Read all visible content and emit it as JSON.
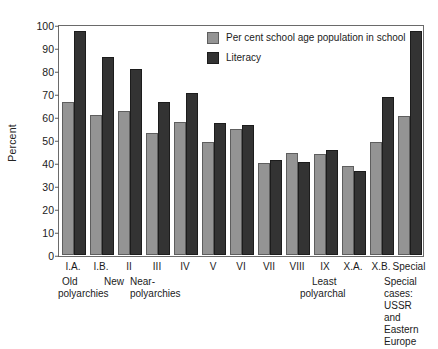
{
  "chart_data": {
    "type": "bar",
    "title": "",
    "xlabel": "",
    "ylabel": "Percent",
    "ylim": [
      0,
      100
    ],
    "yticks": [
      0,
      10,
      20,
      30,
      40,
      50,
      60,
      70,
      80,
      90,
      100
    ],
    "grid": false,
    "legend_position": "top-right",
    "categories": [
      "I.A.",
      "I.B.",
      "II",
      "III",
      "IV",
      "V",
      "VI",
      "VII",
      "VIII",
      "IX",
      "X.A.",
      "X.B.",
      "Special"
    ],
    "series": [
      {
        "name": "Per cent school age population in school",
        "color": "#949494",
        "values": [
          66.5,
          61,
          62.5,
          53,
          58,
          49,
          55,
          40,
          44.5,
          44,
          38.5,
          49,
          60.5
        ]
      },
      {
        "name": "Literacy",
        "color": "#333333",
        "values": [
          97.5,
          86,
          81,
          66.5,
          70.5,
          57.5,
          56.5,
          41.5,
          40.5,
          45.5,
          36.5,
          68.5,
          97.5
        ]
      }
    ],
    "captions": [
      {
        "lines": [
          "Old",
          "polyarchies"
        ],
        "under": "I.A."
      },
      {
        "lines": [
          "New"
        ],
        "under": "I.B."
      },
      {
        "lines": [
          "Near-",
          "polyarchies"
        ],
        "under": "II"
      },
      {
        "lines": [
          "Least",
          "polyarchal"
        ],
        "under": "X.A."
      },
      {
        "lines": [
          "Special",
          "cases:",
          "USSR",
          "and",
          "Eastern",
          "Europe"
        ],
        "under": "Special"
      }
    ]
  },
  "legend": {
    "items": [
      {
        "label": "Per cent school age population in school",
        "swatch": "light"
      },
      {
        "label": "Literacy",
        "swatch": "dark"
      }
    ]
  },
  "axis": {
    "y_title": "Percent",
    "y_ticks": [
      "100",
      "90",
      "80",
      "70",
      "60",
      "50",
      "40",
      "30",
      "20",
      "10",
      "0"
    ],
    "x_ticks": [
      "I.A.",
      "I.B.",
      "II",
      "III",
      "IV",
      "V",
      "VI",
      "VII",
      "VIII",
      "IX",
      "X.A.",
      "X.B.",
      "Special"
    ]
  },
  "captions": {
    "old": "Old",
    "old2": "polyarchies",
    "new": "New",
    "near": "Near-",
    "near2": "polyarchies",
    "least": "Least",
    "least2": "polyarchal",
    "special1": "Special",
    "special2": "cases:",
    "special3": "USSR",
    "special4": "and",
    "special5": "Eastern",
    "special6": "Europe"
  }
}
